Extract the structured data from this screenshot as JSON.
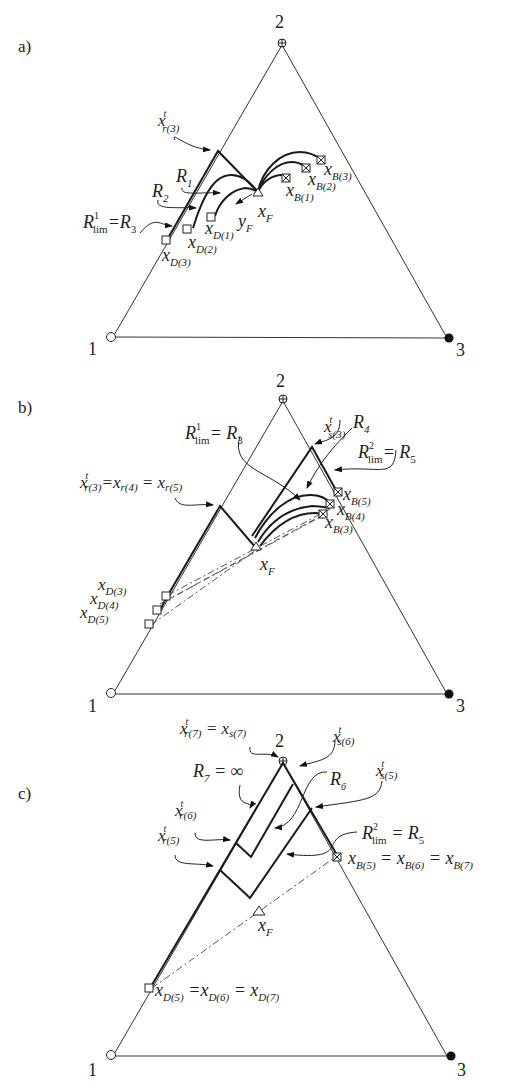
{
  "panels": [
    {
      "id": "a",
      "label": "a)",
      "vertices": {
        "v1": "1",
        "v2": "2",
        "v3": "3"
      },
      "labels": {
        "xr3": "x",
        "xr3_sup": "t",
        "xr3_sub": "r(3)",
        "R1": "R",
        "R1_sub": "1",
        "R2": "R",
        "R2_sub": "2",
        "Rlim": "R",
        "Rlim_sup": "1",
        "Rlim_sub": "lim",
        "Rlim_eq": "=R",
        "Rlim_eq_sub": "3",
        "xF": "x",
        "xF_sub": "F",
        "yF": "y",
        "yF_sub": "F",
        "xB1": "x",
        "xB1_sub": "B(1)",
        "xB2": "x",
        "xB2_sub": "B(2)",
        "xB3": "x",
        "xB3_sub": "B(3)",
        "xD1": "x",
        "xD1_sub": "D(1)",
        "xD2": "x",
        "xD2_sub": "D(2)",
        "xD3": "x",
        "xD3_sub": "D(3)"
      }
    },
    {
      "id": "b",
      "label": "b)",
      "vertices": {
        "v1": "1",
        "v2": "2",
        "v3": "3"
      },
      "labels": {
        "xs3": "x",
        "xs3_sup": "t",
        "xs3_sub": "s(3)",
        "R4": "R",
        "R4_sub": "4",
        "Rlim1": "R",
        "Rlim1_sup": "1",
        "Rlim1_sub": "lim",
        "Rlim1_eq": "= R",
        "Rlim1_eq_sub": "3",
        "Rlim2": "R",
        "Rlim2_sup": "2",
        "Rlim2_sub": "lim",
        "Rlim2_eq": "= R",
        "Rlim2_eq_sub": "5",
        "xr_eq": "x",
        "xr_eq_sup": "t",
        "xr_eq_sub1": "r(3)",
        "xr_eq_mid1": "=x",
        "xr_eq_sub2": "r(4)",
        "xr_eq_mid2": " = x",
        "xr_eq_sub3": "r(5)",
        "xF": "x",
        "xF_sub": "F",
        "xB3": "x",
        "xB3_sub": "B(3)",
        "xB4": "x",
        "xB4_sub": "B(4)",
        "xB5": "x",
        "xB5_sub": "B(5)",
        "xD3": "x",
        "xD3_sub": "D(3)",
        "xD4": "x",
        "xD4_sub": "D(4)",
        "xD5": "x",
        "xD5_sub": "D(5)"
      }
    },
    {
      "id": "c",
      "label": "c)",
      "vertices": {
        "v1": "1",
        "v2": "2",
        "v3": "3"
      },
      "labels": {
        "xr7": "x",
        "xr7_sup": "t",
        "xr7_sub": "r(7)",
        "xr7_eq": " = x",
        "xs7_sub": "s(7)",
        "xs6": "x",
        "xs6_sup": "t",
        "xs6_sub": "s(6)",
        "xs5": "x",
        "xs5_sup": "t",
        "xs5_sub": "s(5)",
        "R7": "R",
        "R7_sub": "7",
        "R7_eq": " = ∞",
        "R6": "R",
        "R6_sub": "6",
        "xr6": "x",
        "xr6_sup": "t",
        "xr6_sub": "r(6)",
        "xr5": "x",
        "xr5_sup": "t",
        "xr5_sub": "r(5)",
        "Rlim2": "R",
        "Rlim2_sup": "2",
        "Rlim2_sub": "lim",
        "Rlim2_eq": " = R",
        "Rlim2_eq_sub": "5",
        "xB": "x",
        "xB_sub1": "B(5)",
        "xB_eq1": " = x",
        "xB_sub2": "B(6)",
        "xB_eq2": " = x",
        "xB_sub3": "B(7)",
        "xF": "x",
        "xF_sub": "F",
        "xD": "x",
        "xD_sub1": "D(5)",
        "xD_eq1": " =x",
        "xD_sub2": "D(6)",
        "xD_eq2": " = x",
        "xD_sub3": "D(7)"
      }
    }
  ],
  "legend_markers": {
    "vertex1": "open-circle",
    "vertex2": "circle-plus",
    "vertex3": "filled-circle",
    "distillate": "open-square",
    "bottoms": "crossed-square",
    "feed": "open-triangle"
  },
  "colors": {
    "ink": "#1a1a1a",
    "background": "#ffffff"
  }
}
